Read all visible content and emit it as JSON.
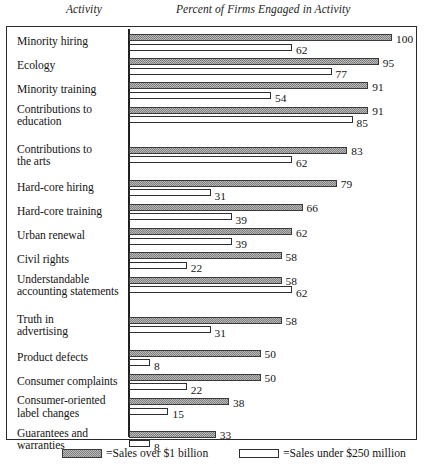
{
  "headers": {
    "activity": "Activity",
    "percent": "Percent of Firms Engaged in Activity"
  },
  "legend": {
    "series_big_label": "=Sales over $1 billion",
    "series_small_label": "=Sales under $250 million",
    "series_big_swatch": "hatched-gray-swatch",
    "series_small_swatch": "white-outline-swatch"
  },
  "colors": {
    "bar_big_fill": "#b9b9b9",
    "bar_big_border": "#3a3a3a",
    "bar_small_fill": "#ffffff",
    "bar_small_border": "#2e2e2e",
    "frame": "#2a2a2a",
    "text": "#141414"
  },
  "chart_data": {
    "type": "bar",
    "orientation": "horizontal",
    "title": "Percent of Firms Engaged in Activity",
    "xlabel": "Percent of Firms Engaged in Activity",
    "ylabel": "Activity",
    "xlim": [
      0,
      100
    ],
    "grid": false,
    "legend_position": "bottom",
    "categories": [
      "Minority hiring",
      "Ecology",
      "Minority training",
      "Contributions to\neducation",
      "Contributions to\nthe arts",
      "Hard-core hiring",
      "Hard-core training",
      "Urban renewal",
      "Civil rights",
      "Understandable\naccounting statements",
      "Truth in\nadvertising",
      "Product defects",
      "Consumer complaints",
      "Consumer-oriented\nlabel changes",
      "Guarantees and\nwarranties"
    ],
    "series": [
      {
        "name": "Sales over $1 billion",
        "values": [
          100,
          95,
          91,
          91,
          83,
          79,
          66,
          62,
          58,
          58,
          58,
          50,
          50,
          38,
          33
        ]
      },
      {
        "name": "Sales under $250 million",
        "values": [
          62,
          77,
          54,
          85,
          62,
          31,
          39,
          39,
          22,
          62,
          31,
          8,
          22,
          15,
          8
        ]
      }
    ],
    "group_breaks_after": [
      4,
      10
    ]
  }
}
